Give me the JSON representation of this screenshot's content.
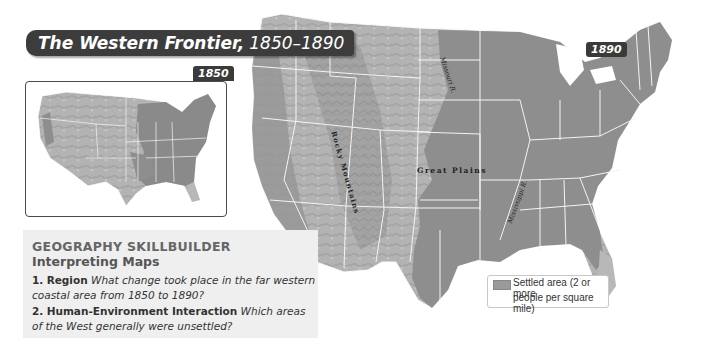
{
  "title": {
    "bold": "The Western Frontier,",
    "years": "1850–1890"
  },
  "inset_map": {
    "year": "1850"
  },
  "main_map": {
    "year": "1890",
    "labels": {
      "rocky_mountains": "Rocky Mountains",
      "great_plains": "Great Plains",
      "missouri_river": "Missouri R.",
      "mississippi_river": "Mississippi R."
    }
  },
  "legend": {
    "swatch_color": "#9a9a9a",
    "line1": "Settled area (2 or more",
    "line2": "people per square mile)"
  },
  "skillbuilder": {
    "heading": "GEOGRAPHY SKILLBUILDER",
    "subheading": "Interpreting Maps",
    "questions": [
      {
        "number": "1.",
        "label": "Region",
        "text": "What change took place in the far western coastal area from 1850 to 1890?"
      },
      {
        "number": "2.",
        "label": "Human-Environment Interaction",
        "text": "Which areas of the West generally were unsettled?"
      }
    ]
  },
  "colors": {
    "settled": "#8e8e8e",
    "unsettled": "#b8b8b8",
    "title_bg": "#3c3c3c",
    "panel_bg": "#efefef"
  }
}
